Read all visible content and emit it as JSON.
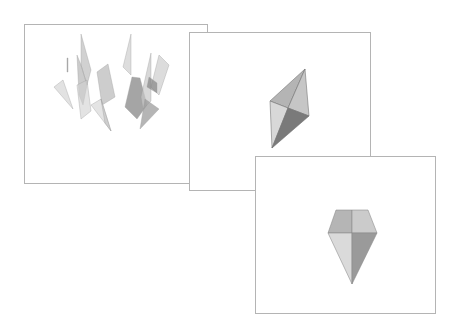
{
  "figure": {
    "panels": [
      {
        "id": "panel-1",
        "stage": "scattered shards",
        "box": {
          "x": 24,
          "y": 24,
          "w": 184,
          "h": 160
        },
        "shards": [
          {
            "points": "42,33 43,33 43,47 42,47",
            "fill": "#9a9a9a",
            "opacity": 0.8
          },
          {
            "points": "29,62 38,55 48,84",
            "fill": "#d6d6d6",
            "opacity": 0.7
          },
          {
            "points": "56,9 66,45 62,60 56,40",
            "fill": "#bdbdbd",
            "opacity": 0.7
          },
          {
            "points": "52,30 56,40 62,60 58,80 54,70",
            "fill": "#a8a8a8",
            "opacity": 0.6
          },
          {
            "points": "72,47 83,39 90,72 77,80",
            "fill": "#b8b8b8",
            "opacity": 0.7
          },
          {
            "points": "52,60 62,55 66,86 56,94",
            "fill": "#d0d0d0",
            "opacity": 0.6
          },
          {
            "points": "66,80 76,74 86,106",
            "fill": "#d9d9d9",
            "opacity": 0.7
          },
          {
            "points": "76,74 86,106 80,98",
            "fill": "#c4c4c4",
            "opacity": 0.7
          },
          {
            "points": "106,9 106,50 98,42",
            "fill": "#cfcfcf",
            "opacity": 0.7
          },
          {
            "points": "107,52 115,53 122,80 112,94 100,82",
            "fill": "#8e8e8e",
            "opacity": 0.8
          },
          {
            "points": "126,28 126,76 118,84 116,72",
            "fill": "#c8c8c8",
            "opacity": 0.7
          },
          {
            "points": "134,30 144,40 134,70 126,62",
            "fill": "#cdcdcd",
            "opacity": 0.7
          },
          {
            "points": "124,52 132,58 132,68 122,62",
            "fill": "#777777",
            "opacity": 0.6
          },
          {
            "points": "120,74 134,84 115,104",
            "fill": "#9c9c9c",
            "opacity": 0.75
          }
        ]
      },
      {
        "id": "panel-2",
        "stage": "partially assembled rhombic gem",
        "box": {
          "x": 189,
          "y": 32,
          "w": 182,
          "h": 159
        },
        "facets": [
          {
            "name": "upper-left",
            "points": "80,68 115,36 98,75",
            "fill": "#b4b4b4"
          },
          {
            "name": "upper-right",
            "points": "115,36 119,83 98,75",
            "fill": "#c6c6c6"
          },
          {
            "name": "lower-left",
            "points": "80,68 98,75 82,115",
            "fill": "#d8d8d8"
          },
          {
            "name": "lower-right",
            "points": "98,75 119,83 82,115",
            "fill": "#7a7a7a"
          }
        ],
        "edge_color": "#6f6f6f"
      },
      {
        "id": "panel-3",
        "stage": "completed gem (front view)",
        "box": {
          "x": 255,
          "y": 156,
          "w": 181,
          "h": 158
        },
        "facets": [
          {
            "name": "crown-left",
            "points": "80,53 96,53 96,76 72,76",
            "fill": "#b5b5b5"
          },
          {
            "name": "crown-right",
            "points": "96,53 112,53 121,76 96,76",
            "fill": "#cbcbcb"
          },
          {
            "name": "pavilion-left",
            "points": "72,76 96,76 96,127",
            "fill": "#dadada"
          },
          {
            "name": "pavilion-right",
            "points": "96,76 121,76 96,127",
            "fill": "#9a9a9a"
          }
        ],
        "edge_color": "#8a8a8a"
      }
    ],
    "colors": {
      "background": "#ffffff",
      "panel_border": "#b4b4b4"
    }
  }
}
